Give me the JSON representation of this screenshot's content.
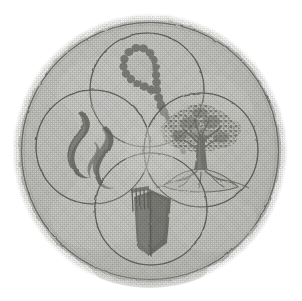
{
  "image": {
    "kind": "scanned-emblem-illustration",
    "title": "Four-circle emblem",
    "medium": "halftone grayscale scan",
    "background_color": "#ffffff",
    "canvas": {
      "width": 302,
      "height": 301
    }
  },
  "disc": {
    "name": "outer-disc",
    "center_x": 150,
    "center_y": 151,
    "radius": 133,
    "fill_color": "#c9c9c5",
    "rim_color": "#8e8e8a",
    "halo_color": "#dcdcd8",
    "halo_radius": 139,
    "outline_color": "#6f6f6c"
  },
  "circles": [
    {
      "id": "top",
      "name": "circle-top-rope",
      "symbol": "beaded-rope-loop",
      "symbol_label": "Beaded rope loop",
      "center_x": 147,
      "center_y": 90,
      "radius": 57,
      "stroke_color": "#5d5d5a",
      "fill_color": "#cacac6",
      "symbol_color": "#7b7b77"
    },
    {
      "id": "left",
      "name": "circle-left-flame",
      "symbol": "flame-smoke-curls",
      "symbol_label": "Twin flame / smoke curls",
      "center_x": 93,
      "center_y": 147,
      "radius": 57,
      "stroke_color": "#5d5d5a",
      "fill_color": "#cdcdc9",
      "symbol_color": "#6d6d69"
    },
    {
      "id": "right",
      "name": "circle-right-tree",
      "symbol": "tree-on-mound",
      "symbol_label": "Broad tree on a rooted mound",
      "center_x": 201,
      "center_y": 150,
      "radius": 57,
      "stroke_color": "#5d5d5a",
      "fill_color": "#cacac6",
      "symbol_color": "#76766f"
    },
    {
      "id": "bottom",
      "name": "circle-bottom-book",
      "symbol": "open-book",
      "symbol_label": "Open book with ruled page",
      "center_x": 151,
      "center_y": 209,
      "radius": 56,
      "stroke_color": "#5d5d5a",
      "fill_color": "#cdcdc9",
      "symbol_color": "#6f6f6b"
    }
  ],
  "palette": {
    "paper": "#ffffff",
    "light_gray": "#dcdcd8",
    "mid_gray": "#c9c9c5",
    "line_gray": "#5d5d5a",
    "dark_ink": "#6a6a66"
  }
}
